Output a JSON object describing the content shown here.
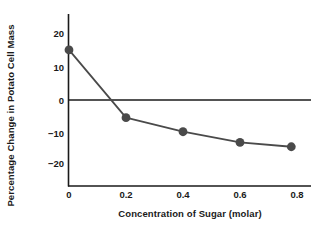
{
  "chart_data": {
    "type": "line",
    "title": "",
    "xlabel": "Concentration of Sugar (molar)",
    "ylabel": "Percentage Change in Potato Cell Mass",
    "x": [
      0,
      0.2,
      0.4,
      0.6,
      0.78
    ],
    "values": [
      15,
      -5.3,
      -9.5,
      -12.7,
      -14
    ],
    "series": [
      {
        "name": "Percentage change in potato cell mass",
        "x": [
          0,
          0.2,
          0.4,
          0.6,
          0.78
        ],
        "values": [
          15,
          -5.3,
          -9.5,
          -12.7,
          -14
        ]
      }
    ],
    "xlim": [
      -0.015,
      0.85
    ],
    "ylim": [
      -26,
      26
    ],
    "xticks": [
      0,
      0.2,
      0.4,
      0.6,
      0.8
    ],
    "xtick_labels": [
      "0",
      "0.2",
      "0.4",
      "0.6",
      "0.8"
    ],
    "yticks": [
      20,
      10,
      0,
      -10,
      -20
    ],
    "ytick_labels": [
      "20",
      "10",
      "0",
      "−10",
      "−20"
    ],
    "grid": false,
    "legend": false,
    "zero_line": true,
    "marker": "circle",
    "colors": {
      "line": "#4a4a4a",
      "marker": "#4a4a4a",
      "axis": "#1a1a1a",
      "zero_line": "#1a1a1a",
      "background": "#ffffff",
      "text": "#1a1a1a"
    }
  }
}
